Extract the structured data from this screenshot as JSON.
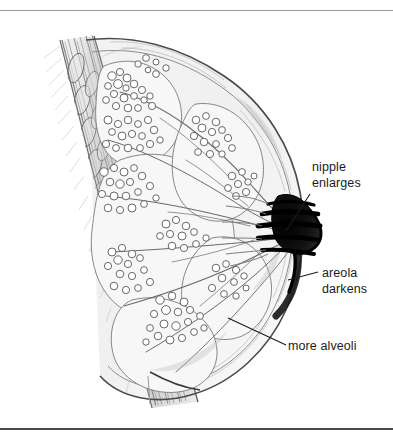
{
  "figure": {
    "style": "pencil line drawing, grayscale",
    "background_color": "#ffffff",
    "ink_color": "#1b1b1b",
    "rules": {
      "top_color": "#9a9a9a",
      "bottom_color": "#4a4a4a"
    }
  },
  "labels": [
    {
      "id": "nipple",
      "line1": "nipple",
      "line2": "enlarges",
      "leader": "diagonal down-left to nipple tip"
    },
    {
      "id": "areola",
      "line1": "areola",
      "line2": "darkens",
      "leader": "horizontal left to areola band"
    },
    {
      "id": "alveoli",
      "line1": "more alveoli",
      "line2": "",
      "leader": "diagonal up-left into lobule cluster"
    }
  ],
  "structures": [
    "chest wall muscle",
    "ribs",
    "fat tissue",
    "glandular lobules",
    "alveoli clusters",
    "lactiferous ducts",
    "nipple",
    "areola"
  ]
}
